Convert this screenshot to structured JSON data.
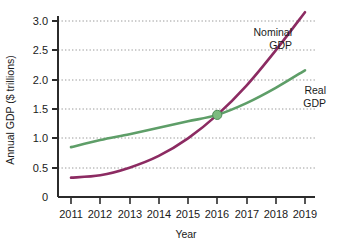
{
  "chart_data": {
    "type": "line",
    "title": "",
    "xlabel": "Year",
    "ylabel": "Annual GDP ($ trillions)",
    "x": [
      2011,
      2012,
      2013,
      2014,
      2015,
      2016,
      2017,
      2018,
      2019
    ],
    "xlim": [
      2010.8,
      2019.1
    ],
    "ylim": [
      0,
      3.2
    ],
    "ytick_labels": [
      "0",
      "0.5",
      "1.0",
      "1.5",
      "2.0",
      "2.5",
      "3.0"
    ],
    "ytick_values": [
      0,
      0.5,
      1.0,
      1.5,
      2.0,
      2.5,
      3.0
    ],
    "xtick_labels": [
      "2011",
      "2012",
      "2013",
      "2014",
      "2015",
      "2016",
      "2017",
      "2018",
      "2019"
    ],
    "grid": "horizontal-dotted",
    "legend_position": "inline-annotations",
    "series": [
      {
        "name": "Nominal GDP",
        "color": "#8c2b62",
        "label_line1": "Nominal",
        "label_line2": "GDP",
        "values": [
          0.33,
          0.37,
          0.5,
          0.7,
          1.0,
          1.4,
          1.9,
          2.5,
          3.15
        ]
      },
      {
        "name": "Real GDP",
        "color": "#5e9e68",
        "label_line1": "Real",
        "label_line2": "GDP",
        "values": [
          0.85,
          0.97,
          1.07,
          1.18,
          1.29,
          1.4,
          1.6,
          1.86,
          2.16
        ]
      }
    ],
    "annotations": [
      {
        "name": "intersection-marker",
        "x": 2016,
        "y": 1.4,
        "color": "#7cbb7f",
        "note": "Nominal GDP equals Real GDP in base year"
      }
    ]
  }
}
